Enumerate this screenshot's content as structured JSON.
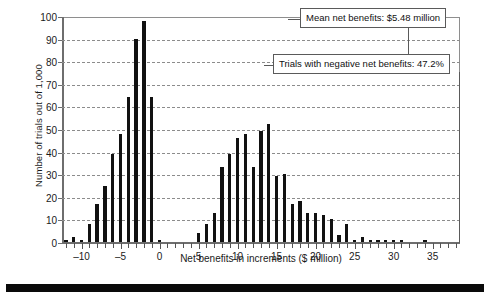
{
  "chart_data": {
    "type": "bar",
    "title": "",
    "xlabel": "Net benefits in increments ($ million)",
    "ylabel": "Number of trials out of 1,000",
    "xlim": [
      -12.5,
      38.5
    ],
    "ylim": [
      0,
      100
    ],
    "grid": true,
    "legend": null,
    "yticks": [
      0,
      10,
      20,
      30,
      40,
      50,
      60,
      70,
      80,
      90,
      100
    ],
    "ytick_labels": [
      "0",
      "10",
      "20",
      "30",
      "40",
      "50",
      "60",
      "70",
      "80",
      "90",
      "100"
    ],
    "xticks": [
      -10,
      -5,
      0,
      5,
      10,
      15,
      20,
      25,
      30,
      35
    ],
    "xtick_labels": [
      "–10",
      "–5",
      "0",
      "5",
      "10",
      "15",
      "20",
      "25",
      "30",
      "35"
    ],
    "xtick_minor_step": 1,
    "bar_color": "#111111",
    "x": [
      -12,
      -11,
      -10,
      -9,
      -8,
      -7,
      -6,
      -5,
      -4,
      -3,
      -2,
      -1,
      0,
      1,
      2,
      3,
      4,
      5,
      6,
      7,
      8,
      9,
      10,
      11,
      12,
      13,
      14,
      15,
      16,
      17,
      18,
      19,
      20,
      21,
      22,
      23,
      24,
      25,
      26,
      27,
      28,
      29,
      30,
      31,
      32,
      33,
      34,
      35,
      36
    ],
    "values": [
      1,
      2,
      1,
      8,
      17,
      25,
      39,
      48,
      64,
      90,
      98,
      64,
      1,
      0,
      0,
      0,
      0,
      4,
      8,
      13,
      33,
      39,
      46,
      48,
      33,
      49,
      52,
      29,
      30,
      17,
      18,
      13,
      13,
      12,
      10,
      3,
      8,
      1,
      2,
      1,
      1,
      1,
      1,
      1,
      0,
      0,
      1,
      0,
      0
    ],
    "annotations": [
      {
        "id": "mean-net-benefits",
        "text": "Mean net benefits: $5.48 million"
      },
      {
        "id": "negative-net-benefits",
        "text": "Trials with negative net benefits: 47.2%"
      }
    ]
  }
}
